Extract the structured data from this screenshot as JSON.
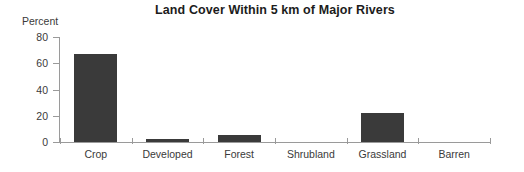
{
  "chart_data": {
    "type": "bar",
    "title": "Land Cover Within 5 km of Major Rivers",
    "xlabel": "",
    "ylabel": "Percent",
    "categories": [
      "Crop",
      "Developed",
      "Forest",
      "Shrubland",
      "Grassland",
      "Barren"
    ],
    "values": [
      67,
      2,
      5.5,
      0,
      22,
      0
    ],
    "ylim": [
      0,
      80
    ],
    "yticks": [
      0,
      20,
      40,
      60,
      80
    ],
    "ytick_labels": [
      "0",
      "20",
      "40",
      "60",
      "80"
    ],
    "grid": false,
    "legend": "none",
    "bar_color": "#3a3a3a",
    "axis_color": "#9a9a9a",
    "background_color": "#ffffff"
  },
  "axis": {
    "y_title": "Percent",
    "tick_labels": [
      "80",
      "60",
      "40",
      "20",
      "0"
    ]
  },
  "categories": {
    "c0": "Crop",
    "c1": "Developed",
    "c2": "Forest",
    "c3": "Shrubland",
    "c4": "Grassland",
    "c5": "Barren"
  }
}
